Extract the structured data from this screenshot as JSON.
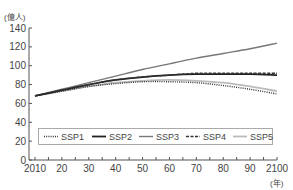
{
  "chart_data": {
    "type": "line",
    "title": "",
    "xlabel": "(年)",
    "ylabel": "(億人)",
    "x": [
      2010,
      2020,
      2030,
      2040,
      2050,
      2060,
      2070,
      2080,
      2090,
      2100
    ],
    "x_tick_labels": [
      "2010",
      "20",
      "30",
      "40",
      "50",
      "60",
      "70",
      "80",
      "90",
      "2100"
    ],
    "y_ticks": [
      0,
      20,
      40,
      60,
      80,
      100,
      120,
      140
    ],
    "xlim": [
      2010,
      2100
    ],
    "ylim": [
      0,
      140
    ],
    "grid": false,
    "legend_position": "bottom-inside",
    "series": [
      {
        "name": "SSP1",
        "style": "dotted",
        "color": "#333333",
        "values": [
          68,
          73,
          78,
          81,
          83,
          83,
          82,
          79,
          75,
          70
        ]
      },
      {
        "name": "SSP2",
        "style": "solid-thick",
        "color": "#222222",
        "values": [
          68,
          74,
          80,
          85,
          88,
          90,
          91,
          91,
          91,
          90
        ]
      },
      {
        "name": "SSP3",
        "style": "solid",
        "color": "#777777",
        "values": [
          68,
          75,
          82,
          89,
          96,
          102,
          108,
          113,
          118,
          124
        ]
      },
      {
        "name": "SSP4",
        "style": "dashed",
        "color": "#333333",
        "values": [
          68,
          74,
          80,
          85,
          88,
          90,
          92,
          92,
          92,
          92
        ]
      },
      {
        "name": "SSP5",
        "style": "solid-light",
        "color": "#bbbbbb",
        "values": [
          68,
          73,
          78,
          82,
          84,
          85,
          84,
          82,
          78,
          73
        ]
      }
    ]
  },
  "axis": {
    "y_unit": "(億人)",
    "x_unit": "(年)"
  }
}
